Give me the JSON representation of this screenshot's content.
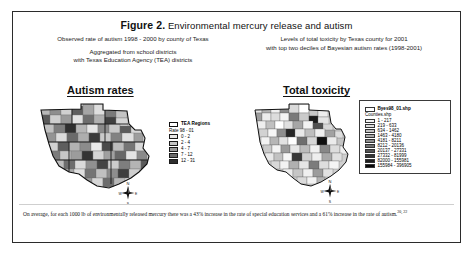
{
  "figure": {
    "label": "Figure 2.",
    "title": "Environmental mercury release and autism"
  },
  "subtitles": {
    "left_line1": "Observed rate of autism 1998 - 2000 by county of Texas",
    "left_line2": "Aggregated from school districts",
    "left_line3": "with Texas Education Agency (TEA) districts",
    "right_line1": "Levels of total toxicity by Texas county for 2001",
    "right_line2": "with top two deciles of Bayesian autism rates (1998-2001)"
  },
  "panels": [
    {
      "heading": "Autism rates",
      "legend": {
        "regions_label": "TEA Regions",
        "rate_label": "Rate 98 - 01",
        "classes": [
          {
            "range": "0 - 2",
            "color": "#e8e8e8"
          },
          {
            "range": "2 - 4",
            "color": "#c6c6c6"
          },
          {
            "range": "4 - 7",
            "color": "#9a9a9a"
          },
          {
            "range": "7 - 12",
            "color": "#6a6a6a"
          },
          {
            "range": "12 - 31",
            "color": "#2e2e2e"
          }
        ]
      }
    },
    {
      "heading": "Total toxicity",
      "legend": {
        "layer1": "Byes98_01.shp",
        "layer2": "Counties.shp",
        "classes": [
          {
            "range": "1 - 217",
            "color": "#f2f2f2"
          },
          {
            "range": "219 - 633",
            "color": "#dcdcdc"
          },
          {
            "range": "634 - 1462",
            "color": "#c2c2c2"
          },
          {
            "range": "1463 - 4180",
            "color": "#a8a8a8"
          },
          {
            "range": "4181 - 8211",
            "color": "#8e8e8e"
          },
          {
            "range": "8212 - 20136",
            "color": "#707070"
          },
          {
            "range": "20137 - 27331",
            "color": "#545454"
          },
          {
            "range": "27332 - 81999",
            "color": "#363636"
          },
          {
            "range": "82000 - 155981",
            "color": "#1e1e1e"
          },
          {
            "range": "155984 - 396905",
            "color": "#080808"
          }
        ]
      }
    }
  ],
  "compass": {
    "north": "N",
    "south": "S",
    "east": "E",
    "west": "W"
  },
  "caption": {
    "text": "On average, for each 1000 lb of environmentally released mercury there was a 43% increase in the rate of special education services and a 61% increase in the rate of autism.",
    "refs": "20, 22"
  },
  "colors": {
    "frame": "#2b2b2b",
    "text": "#111111",
    "map_outline": "#333333"
  }
}
